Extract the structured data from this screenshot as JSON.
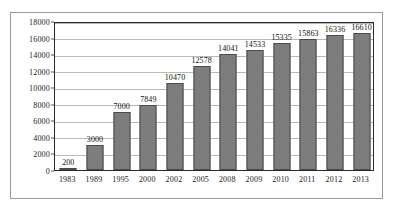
{
  "chart_data": {
    "type": "bar",
    "title": "",
    "subtitle": "",
    "xlabel": "",
    "ylabel": "",
    "categories": [
      "1983",
      "1989",
      "1995",
      "2000",
      "2002",
      "2005",
      "2008",
      "2009",
      "2010",
      "2011",
      "2012",
      "2013"
    ],
    "values": [
      200,
      3000,
      7000,
      7849,
      10470,
      12578,
      14041,
      14533,
      15335,
      15863,
      16336,
      16610
    ],
    "data_labels": [
      "200",
      "3000",
      "7000",
      "7849",
      "10470",
      "12578",
      "14041",
      "14533",
      "15335",
      "15863",
      "16336",
      "16610"
    ],
    "ylim": [
      0,
      18000
    ],
    "ytick_step": 2000,
    "ytick_labels": [
      "0",
      "2000",
      "4000",
      "6000",
      "8000",
      "10000",
      "12000",
      "14000",
      "16000",
      "18000"
    ],
    "ytick_values": [
      0,
      2000,
      4000,
      6000,
      8000,
      10000,
      12000,
      14000,
      16000,
      18000
    ],
    "grid": true,
    "grid_orientation": "horizontal",
    "legend": false,
    "legend_position": "none",
    "series": [
      {
        "name": "",
        "values": [
          200,
          3000,
          7000,
          7849,
          10470,
          12578,
          14041,
          14533,
          15335,
          15863,
          16336,
          16610
        ]
      }
    ],
    "colors": {
      "bar_fill": "#7d7d7d",
      "bar_border": "#4a4a4a",
      "gridline": "#b9b9b9",
      "plot_border": "#2a2a2a",
      "card_border": "#9a9a9a",
      "background": "#ffffff",
      "text": "#111111"
    }
  }
}
